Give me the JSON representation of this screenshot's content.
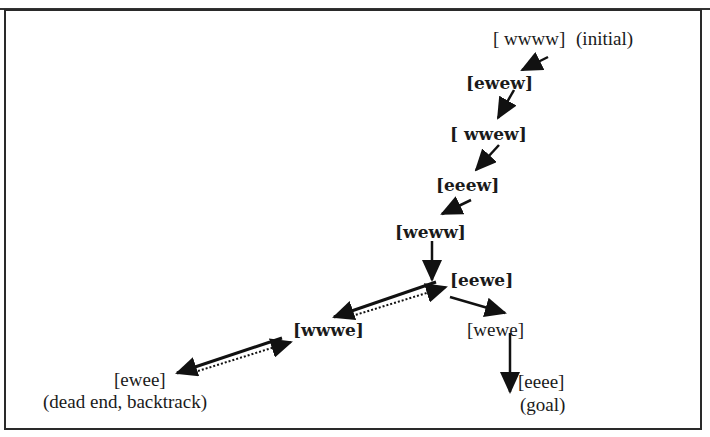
{
  "diagram": {
    "type": "state-space search path",
    "nodes": [
      {
        "id": "wwww",
        "label": "[ wwww]",
        "note": "(initial)"
      },
      {
        "id": "ewew",
        "label": "[ewew]"
      },
      {
        "id": "wwew",
        "label": "[ wwew]"
      },
      {
        "id": "eeew",
        "label": "[eeew]"
      },
      {
        "id": "weww",
        "label": "[weww]"
      },
      {
        "id": "eewe",
        "label": "[eewe]"
      },
      {
        "id": "wwwe",
        "label": "[wwwe]"
      },
      {
        "id": "ewee",
        "label": "[ewee]",
        "note": "(dead end, backtrack)"
      },
      {
        "id": "wewe",
        "label": "[wewe]"
      },
      {
        "id": "eeee",
        "label": "[eeee]",
        "note": "(goal)"
      }
    ],
    "edges": [
      {
        "from": "wwww",
        "to": "ewew"
      },
      {
        "from": "ewew",
        "to": "wwew"
      },
      {
        "from": "wwew",
        "to": "eeew"
      },
      {
        "from": "eeew",
        "to": "weww"
      },
      {
        "from": "weww",
        "to": "eewe"
      },
      {
        "from": "eewe",
        "to": "wwwe"
      },
      {
        "from": "wwwe",
        "to": "eewe",
        "style": "dotted",
        "meaning": "backtrack"
      },
      {
        "from": "wwwe",
        "to": "ewee"
      },
      {
        "from": "ewee",
        "to": "wwwe",
        "style": "dotted",
        "meaning": "backtrack"
      },
      {
        "from": "eewe",
        "to": "wewe"
      },
      {
        "from": "wewe",
        "to": "eeee"
      }
    ]
  }
}
